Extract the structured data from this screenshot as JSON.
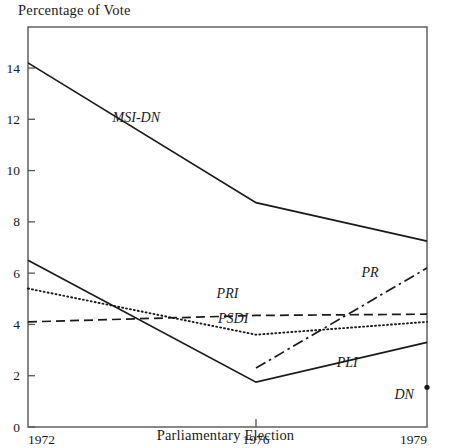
{
  "chart_data": {
    "type": "line",
    "title": "",
    "ylabel": "Percentage of Vote",
    "xlabel": "Parliamentary Election",
    "x": [
      1972,
      1976,
      1979
    ],
    "xtick_labels": [
      "1972",
      "1976",
      "1979"
    ],
    "ytick_labels": [
      "0",
      "2",
      "4",
      "6",
      "8",
      "10",
      "12",
      "14"
    ],
    "yticks": [
      0,
      2,
      4,
      6,
      8,
      10,
      12,
      14
    ],
    "ylim": [
      0,
      15.6
    ],
    "xlim": [
      1972,
      1979
    ],
    "grid": false,
    "legend": "inline-labels",
    "series": [
      {
        "name": "MSI-DN",
        "style": "solid",
        "x": [
          1972,
          1976,
          1979
        ],
        "values": [
          14.2,
          8.75,
          7.25
        ]
      },
      {
        "name": "PLI",
        "style": "solid",
        "x": [
          1972,
          1976,
          1979
        ],
        "values": [
          6.5,
          1.75,
          3.3
        ]
      },
      {
        "name": "PSDI",
        "style": "dotted",
        "x": [
          1972,
          1976,
          1979
        ],
        "values": [
          5.4,
          3.6,
          4.1
        ]
      },
      {
        "name": "PRI",
        "style": "dashed",
        "x": [
          1972,
          1976,
          1979
        ],
        "values": [
          4.1,
          4.35,
          4.4
        ]
      },
      {
        "name": "PR",
        "style": "dashdot",
        "x": [
          1976,
          1979
        ],
        "values": [
          2.3,
          6.2
        ]
      },
      {
        "name": "DN",
        "style": "point",
        "x": [
          1979
        ],
        "values": [
          1.55
        ]
      }
    ],
    "annotations": [
      {
        "text": "MSI-DN",
        "x": 1973.9,
        "y": 11.9
      },
      {
        "text": "PRI",
        "x": 1975.5,
        "y": 5.05
      },
      {
        "text": "PSDI",
        "x": 1975.6,
        "y": 4.05
      },
      {
        "text": "PR",
        "x": 1978.0,
        "y": 5.85
      },
      {
        "text": "PLI",
        "x": 1977.6,
        "y": 2.35
      },
      {
        "text": "DN",
        "x": 1978.6,
        "y": 1.1
      }
    ],
    "colors": {
      "ink": "#1a1a1a",
      "axis": "#555555",
      "background": "#ffffff"
    }
  }
}
